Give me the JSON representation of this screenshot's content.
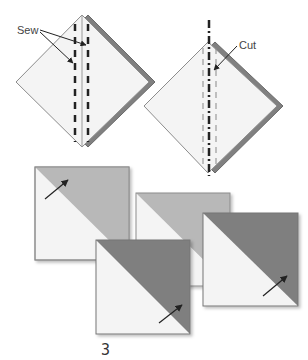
{
  "diagram": {
    "type": "quilting-instructions",
    "step_label": "3",
    "panels": {
      "sew": {
        "label": "Sew",
        "description": "Two stitched squares layered; two dashed sew lines either side of diagonal"
      },
      "cut": {
        "label": "Cut",
        "description": "Dash-dot cut line down the diagonal between sew lines"
      }
    },
    "squares": [
      {
        "name": "half-square-triangle-1",
        "shade": "light",
        "arrow": "up-right"
      },
      {
        "name": "half-square-triangle-2",
        "shade": "light",
        "arrow": "none"
      },
      {
        "name": "half-square-triangle-3",
        "shade": "dark",
        "arrow": "up-right"
      },
      {
        "name": "half-square-triangle-4",
        "shade": "dark",
        "arrow": "up-right"
      }
    ],
    "colors": {
      "white": "#f4f4f4",
      "light": "#b8b8b8",
      "dark": "#7f7f7f",
      "back_layer": "#808080",
      "line": "#222222"
    }
  }
}
